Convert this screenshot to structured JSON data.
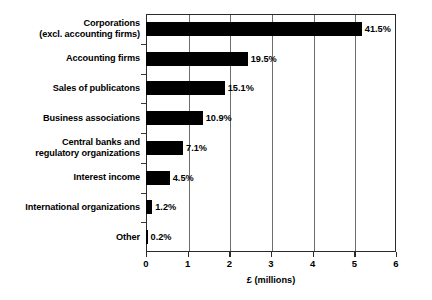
{
  "chart_data": {
    "type": "bar",
    "orientation": "horizontal",
    "title": "",
    "subtitle": "",
    "xlabel": "£ (millions)",
    "ylabel": "",
    "xlim": [
      0,
      6
    ],
    "ylim": null,
    "grid": "vertical",
    "legend": null,
    "categories": [
      "Corporations\n(excl. accounting firms)",
      "Accounting firms",
      "Sales of publicatons",
      "Business associations",
      "Central banks and\nregulatory organizations",
      "Interest income",
      "International organizations",
      "Other"
    ],
    "values": [
      5.18,
      2.44,
      1.89,
      1.36,
      0.89,
      0.57,
      0.15,
      0.03
    ],
    "value_unit": "£ millions",
    "data_labels": [
      "41.5%",
      "19.5%",
      "15.1%",
      "10.9%",
      "7.1%",
      "4.5%",
      "1.2%",
      "0.2%"
    ],
    "percentages": [
      41.5,
      19.5,
      15.1,
      10.9,
      7.1,
      4.5,
      1.2,
      0.2
    ],
    "xticks": [
      0,
      1,
      2,
      3,
      4,
      5,
      6
    ],
    "xtick_labels": [
      "0",
      "1",
      "2",
      "3",
      "4",
      "5",
      "6"
    ],
    "gridlines_at": [
      1,
      2,
      3,
      4,
      5
    ],
    "bar_color": "#000000",
    "frame_color": "#2a2a2a",
    "grid_color": "#6d6d6d",
    "background": "#ffffff"
  }
}
